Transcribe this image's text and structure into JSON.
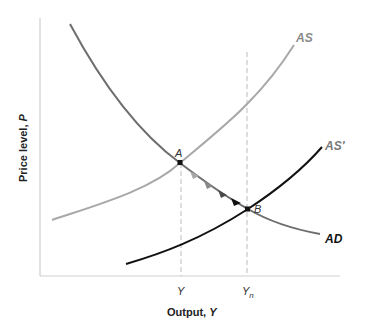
{
  "diagram": {
    "title": "",
    "axes": {
      "x_label": "Output, ",
      "x_label_var": "Y",
      "y_label": "Price level, ",
      "y_label_var": "P",
      "x_ticks": [
        {
          "label": "Y",
          "sub": ""
        },
        {
          "label": "Y",
          "sub": "n"
        }
      ]
    },
    "curves": [
      {
        "name": "AD",
        "label": "AD",
        "color": "#6e6e6e",
        "style": "solid"
      },
      {
        "name": "AS",
        "label": "AS",
        "color": "#a8a8a8",
        "style": "solid"
      },
      {
        "name": "AS'",
        "label": "AS'",
        "color": "#111111",
        "style": "solid"
      }
    ],
    "points": [
      {
        "label": "A",
        "desc": "intersection of AD and AS at output Y"
      },
      {
        "label": "B",
        "desc": "intersection of AD and AS' at natural output Yn"
      }
    ],
    "arrows": {
      "desc": "arrows along AD moving from A to B",
      "count": 4
    },
    "colors": {
      "axis": "#cfcfcf",
      "dashed": "#bdbdbd",
      "point": "#111111",
      "label_gray": "#7a7a7a",
      "text": "#222222"
    }
  }
}
